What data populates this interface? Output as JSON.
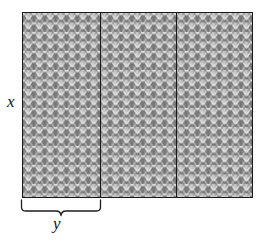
{
  "labels": {
    "height_label": "x",
    "panel_width_label": "y"
  },
  "colors": {
    "outline": "#1a1a1a",
    "fabric_mid": "#8d8d8d",
    "fabric_light": "#e8e8e8",
    "fabric_dark": "#565656",
    "background": "#ffffff",
    "text": "#161616"
  },
  "geometry": {
    "rect_left": 22,
    "rect_top": 12,
    "rect_width": 231,
    "rect_height": 186,
    "panel_count": 3,
    "divider_x_positions": [
      100,
      176
    ],
    "brace_left": 20,
    "brace_right": 102,
    "brace_top": 199
  },
  "icons": {
    "brace": "curly-brace-down"
  }
}
